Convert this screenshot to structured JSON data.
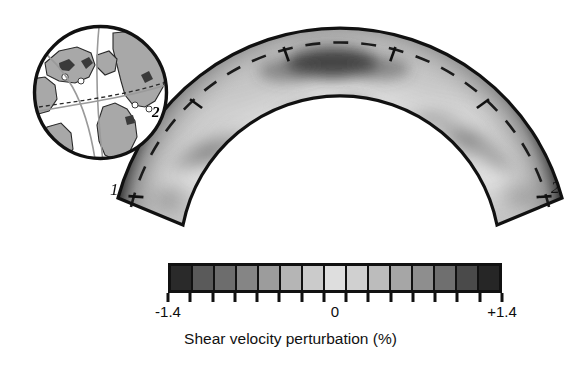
{
  "figure": {
    "background_color": "#ffffff"
  },
  "cross_section": {
    "start_label": "1",
    "end_label": "2",
    "globe_end_label": "2",
    "outline_color": "#111111",
    "dashed_line_color": "#1a1a1a",
    "description": "Arc-shaped mantle cross-section between points 1 and 2"
  },
  "globe": {
    "name": "globe-inset",
    "ocean_color": "#ffffff",
    "land_color": "#a8a8a8",
    "outline_color": "#111111",
    "path_color": "#9a9a9a"
  },
  "colorbar": {
    "label_left": "-1.4",
    "label_center": "0",
    "label_right": "+1.4",
    "caption": "Shear velocity perturbation (%)",
    "cells": [
      "#2a2a2a",
      "#5a5a5a",
      "#6d6d6d",
      "#858585",
      "#9c9c9c",
      "#b5b5b5",
      "#cbcbcb",
      "#dedede",
      "#d0d0d0",
      "#bcbcbc",
      "#a6a6a6",
      "#8e8e8e",
      "#6f6f6f",
      "#4a4a4a",
      "#262626"
    ],
    "tick_count": 16
  },
  "chart_data": {
    "type": "heatmap",
    "subtitle": "",
    "xlabel": "",
    "ylabel": "",
    "colorbar_label": "Shear velocity perturbation (%)",
    "colorbar_ticks": [
      "-1.4",
      "0",
      "+1.4"
    ],
    "clim": [
      -1.4,
      1.4
    ],
    "grid": false,
    "legend_position": "bottom",
    "annotations": [
      "1",
      "2"
    ],
    "geometry": "annular wedge (mantle cross-section)",
    "cells_count": 15
  }
}
